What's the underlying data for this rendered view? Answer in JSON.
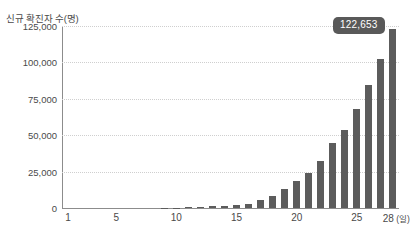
{
  "chart_data": {
    "type": "bar",
    "title": "",
    "subtitle": "",
    "xlabel": "일",
    "ylabel": "신규 확진자 수(명)",
    "x_unit_label": "(일)",
    "categories": [
      1,
      2,
      3,
      4,
      5,
      6,
      7,
      8,
      9,
      10,
      11,
      12,
      13,
      14,
      15,
      16,
      17,
      18,
      19,
      20,
      21,
      22,
      23,
      24,
      25,
      26,
      27,
      28
    ],
    "values": [
      0,
      0,
      0,
      0,
      0,
      0,
      0,
      0,
      150,
      300,
      600,
      900,
      1200,
      1500,
      2000,
      2600,
      5800,
      8500,
      12800,
      18800,
      24000,
      32400,
      44800,
      53500,
      67800,
      84800,
      102600,
      122653
    ],
    "ylim": [
      0,
      125000
    ],
    "yticks": [
      0,
      25000,
      50000,
      75000,
      100000,
      125000
    ],
    "ytick_labels": [
      "0",
      "25,000",
      "50,000",
      "75,000",
      "100,000",
      "125,000"
    ],
    "xticks": [
      1,
      5,
      10,
      15,
      20,
      25,
      28
    ],
    "xtick_labels": [
      "1",
      "5",
      "10",
      "15",
      "20",
      "25",
      "28"
    ],
    "grid": true,
    "grid_axis": "y",
    "legend": false,
    "bar_color": "#5c5c5c",
    "annotations": [
      {
        "text": "122,653",
        "target_category": 28,
        "background_color": "#595959",
        "text_color": "#ffffff"
      }
    ]
  }
}
